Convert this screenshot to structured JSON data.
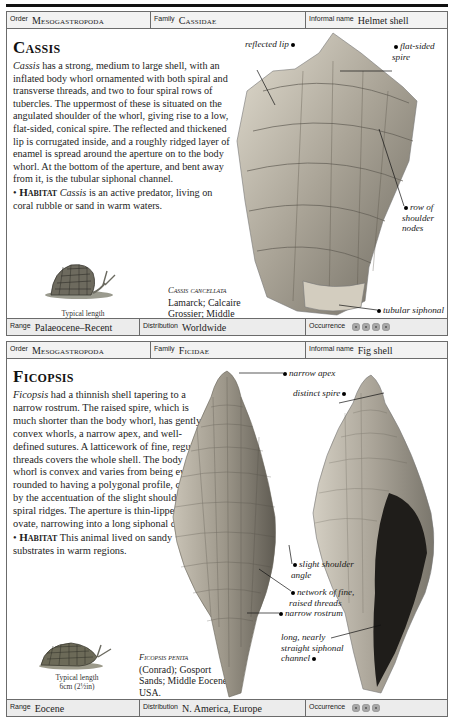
{
  "entries": [
    {
      "header": {
        "order_label": "Order",
        "order_value": "Mesogastropoda",
        "family_label": "Family",
        "family_value": "Cassidae",
        "informal_label": "Informal name",
        "informal_value": "Helmet shell"
      },
      "title": "Cassis",
      "description_lead": "Cassis",
      "description": " has a strong, medium to large shell, with an inflated body whorl ornamented with both spiral and transverse threads, and two to four spiral rows of tubercles. The uppermost of these is situated on the angulated shoulder of the whorl, giving rise to a low, flat-sided, conical spire. The reflected and thickened lip is corrugated inside, and a roughly ridged layer of enamel is spread around the aperture on to the body whorl. At the bottom of the aperture, and bent away from it, is the tubular siphonal channel.",
      "habitat_label": "Habitat",
      "habitat_lead": "Cassis",
      "habitat_text": " is an active predator, living on coral rubble or sand in warm waters.",
      "typical_length_label": "Typical length",
      "typical_length_value": "10cm (4in)",
      "specimen_name": "Cassis cancellata",
      "specimen_details": "Lamarck; Calcaire Grossier; Middle Eocene; France.",
      "annotations": [
        "reflected lip",
        "flat-sided spire",
        "row of shoulder nodes",
        "tubular siphonal channel"
      ],
      "footer": {
        "range_label": "Range",
        "range_value": "Palaeocene–Recent",
        "distribution_label": "Distribution",
        "distribution_value": "Worldwide",
        "occurrence_label": "Occurrence",
        "occurrence_count": 4
      }
    },
    {
      "header": {
        "order_label": "Order",
        "order_value": "Mesogastropoda",
        "family_label": "Family",
        "family_value": "Ficidae",
        "informal_label": "Informal name",
        "informal_value": "Fig shell"
      },
      "title": "Ficopsis",
      "description_lead": "Ficopsis",
      "description": " had a thinnish shell tapering to a narrow rostrum. The raised spire, which is much shorter than the body whorl, has gently convex whorls, a narrow apex, and well-defined sutures. A latticework of fine, regular threads covers the whole shell. The body whorl is convex and varies from being evenly rounded to having a polygonal profile, caused by the accentuation of the slight shoulder and spiral ridges. The aperture is thin-lipped and ovate, narrowing into a long siphonal channel.",
      "habitat_label": "Habitat",
      "habitat_text": " This animal lived on sandy substrates in warm regions.",
      "typical_length_label": "Typical length",
      "typical_length_value": "6cm (2½in)",
      "specimen_name": "Ficopsis penita",
      "specimen_details": "(Conrad); Gosport Sands; Middle Eocene; USA.",
      "annotations": [
        "narrow apex",
        "distinct spire",
        "slight shoulder angle",
        "network of fine, raised threads",
        "narrow rostrum",
        "long, nearly straight siphonal channel"
      ],
      "footer": {
        "range_label": "Range",
        "range_value": "Eocene",
        "distribution_label": "Distribution",
        "distribution_value": "N. America, Europe",
        "occurrence_label": "Occurrence",
        "occurrence_count": 3
      }
    }
  ],
  "colors": {
    "border": "#6b6b6b",
    "header_bg": "#f2f2f2",
    "footer_bg": "#ececec",
    "occurrence_dot": "#a9a9a9",
    "text": "#1a1a1a"
  }
}
